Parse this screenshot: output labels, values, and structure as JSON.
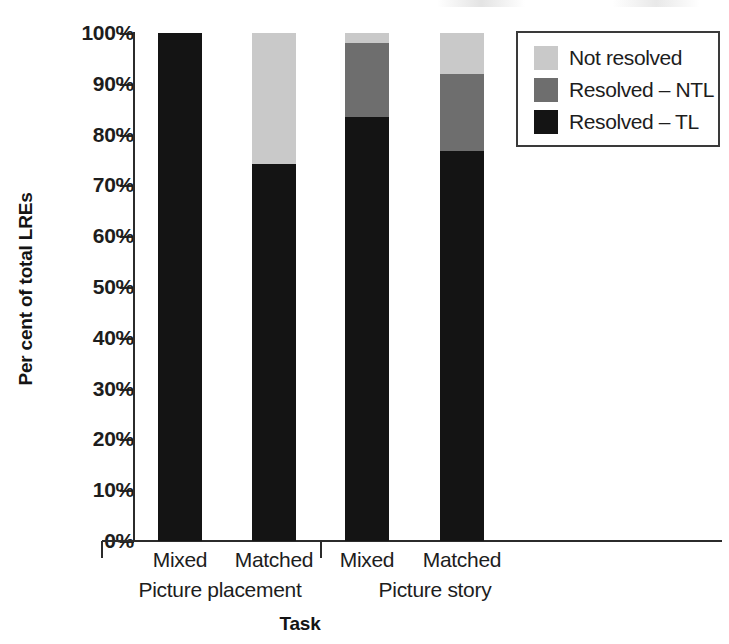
{
  "chart_data": {
    "type": "bar",
    "title": "",
    "subtitle": "",
    "stacked": true,
    "stack_mode": "percent",
    "xlabel": "Task",
    "ylabel": "Per cent of total LREs",
    "ylim": [
      0,
      100
    ],
    "ytick_labels": [
      "100%",
      "90%",
      "80%",
      "70%",
      "60%",
      "50%",
      "40%",
      "30%",
      "20%",
      "10%",
      "0%"
    ],
    "ytick_values": [
      100,
      90,
      80,
      70,
      60,
      50,
      40,
      30,
      20,
      10,
      0
    ],
    "grid": false,
    "legend_position": "top-right",
    "categories": [
      "Mixed",
      "Matched",
      "Mixed",
      "Matched"
    ],
    "groups": [
      {
        "label": "Picture placement",
        "categories": [
          "Mixed",
          "Matched"
        ]
      },
      {
        "label": "Picture story",
        "categories": [
          "Mixed",
          "Matched"
        ]
      }
    ],
    "series": [
      {
        "name": "Not resolved",
        "color": "#c9c9c9",
        "values": [
          0,
          25.7,
          2.0,
          8.0
        ]
      },
      {
        "name": "Resolved – NTL",
        "color": "#6e6e6e",
        "values": [
          0,
          0,
          14.5,
          15.2
        ]
      },
      {
        "name": "Resolved – TL",
        "color": "#141414",
        "values": [
          100,
          74.3,
          83.5,
          76.8
        ]
      }
    ]
  },
  "legend": {
    "entries": [
      {
        "label": "Not resolved",
        "swatch": "#c9c9c9"
      },
      {
        "label": "Resolved – NTL",
        "swatch": "#6e6e6e"
      },
      {
        "label": "Resolved – TL",
        "swatch": "#141414"
      }
    ]
  },
  "axes": {
    "y_title": "Per cent of total LREs",
    "x_title": "Task",
    "y_ticks": [
      "100%",
      "90%",
      "80%",
      "70%",
      "60%",
      "50%",
      "40%",
      "30%",
      "20%",
      "10%",
      "0%"
    ]
  },
  "x_labels": {
    "bar1": "Mixed",
    "bar2": "Matched",
    "bar3": "Mixed",
    "bar4": "Matched",
    "group1": "Picture placement",
    "group2": "Picture story"
  }
}
